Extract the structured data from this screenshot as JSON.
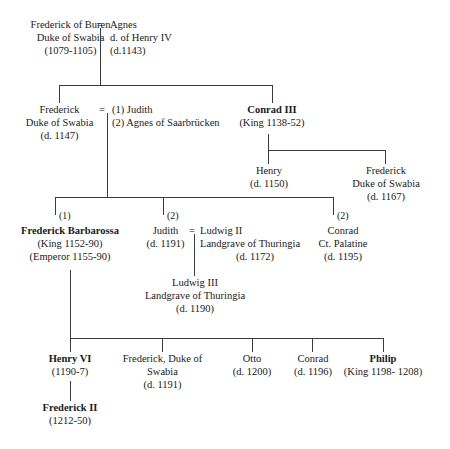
{
  "nodes": {
    "frederick_of_buren": {
      "lines": [
        "Frederick of Buren",
        "Duke of Swabia",
        "(1079-1105)"
      ]
    },
    "agnes": {
      "lines": [
        "Agnes",
        "d. of Henry IV",
        "(d.1143)"
      ]
    },
    "frederick_duke_swabia_1147": {
      "lines": [
        "Frederick",
        "Duke of Swabia",
        "(d. 1147)"
      ]
    },
    "judith_agnes_wives": {
      "lines": [
        "(1) Judith",
        "(2) Agnes of Saarbrücken"
      ]
    },
    "conrad_iii": {
      "lines": [
        "Conrad III",
        "(King 1138-52)"
      ]
    },
    "henry_1150": {
      "lines": [
        "Henry",
        "(d. 1150)"
      ]
    },
    "frederick_duke_swabia_1167": {
      "lines": [
        "Frederick",
        "Duke of Swabia",
        "(d. 1167)"
      ]
    },
    "frederick_barbarossa": {
      "lines": [
        "Frederick Barbarossa",
        "(King 1152-90)",
        "(Emperor 1155-90)"
      ]
    },
    "judith_1191": {
      "lines": [
        "Judith",
        "(d. 1191)"
      ]
    },
    "ludwig_ii": {
      "lines": [
        "Ludwig II",
        "Landgrave of Thuringia",
        "(d. 1172)"
      ]
    },
    "conrad_ct_palatine": {
      "lines": [
        "Conrad",
        "Ct. Palatine",
        "(d. 1195)"
      ]
    },
    "ludwig_iii": {
      "lines": [
        "Ludwig III",
        "Landgrave of Thuringia",
        "(d. 1190)"
      ]
    },
    "henry_vi": {
      "lines": [
        "Henry VI",
        "(1190-7)"
      ]
    },
    "frederick_duke_swabia_1191": {
      "lines": [
        "Frederick, Duke of",
        "Swabia",
        "(d. 1191)"
      ]
    },
    "otto_1200": {
      "lines": [
        "Otto",
        "(d. 1200)"
      ]
    },
    "conrad_1196": {
      "lines": [
        "Conrad",
        "(d. 1196)"
      ]
    },
    "philip": {
      "lines": [
        "Philip",
        "(King 1198- 1208)"
      ]
    },
    "frederick_ii": {
      "lines": [
        "Frederick II",
        "(1212-50)"
      ]
    }
  },
  "marriage_symbols": {
    "buren_agnes": "=",
    "frederick_judith": "=",
    "judith_ludwig": "="
  },
  "birth_order_markers": {
    "barbarossa": "(1)",
    "judith": "(2)",
    "conrad": "(2)"
  },
  "colors": {
    "line": "#3a3a42",
    "text": "#1a1a1a",
    "background": "#ffffff"
  }
}
